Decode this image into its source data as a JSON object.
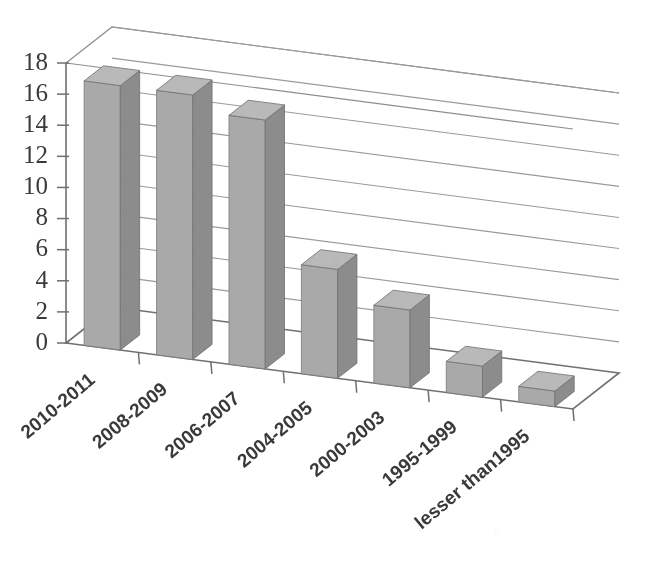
{
  "chart_data": {
    "type": "bar",
    "title": "",
    "subtitle": "",
    "xlabel": "",
    "ylabel": "",
    "categories": [
      "2010-2011",
      "2008-2009",
      "2006-2007",
      "2004-2005",
      "2000-2003",
      "1995-1999",
      "lesser than1995"
    ],
    "values": [
      17,
      17,
      16,
      7,
      5,
      2,
      1
    ],
    "ylim": [
      0,
      18
    ],
    "ytick_labels": [
      "0",
      "2",
      "4",
      "6",
      "8",
      "10",
      "12",
      "14",
      "16",
      "18"
    ],
    "ytick_values": [
      0,
      2,
      4,
      6,
      8,
      10,
      12,
      14,
      16,
      18
    ],
    "ystep": 2,
    "grid": true,
    "legend": false,
    "legend_position": "none",
    "style": "3d-column",
    "series": [
      {
        "name": "Series 1",
        "values": [
          17,
          17,
          16,
          7,
          5,
          2,
          1
        ]
      }
    ]
  },
  "colors": {
    "bar_front": "#a9a9a9",
    "bar_side": "#8c8c8c",
    "bar_top": "#b9b9b9",
    "gridline": "#9a9a9a",
    "axis": "#6f6f6f",
    "text": "#3a3a3a",
    "background": "#ffffff"
  },
  "axes": {
    "y_axis_name": "value-axis",
    "x_axis_name": "category-axis"
  }
}
